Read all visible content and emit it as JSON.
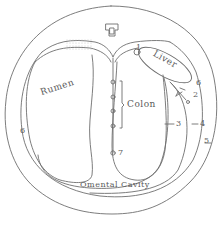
{
  "diagram": {
    "type": "anatomical cross-section",
    "colors": {
      "line": "#6e6e6e",
      "text": "#5a5a5a",
      "background": "#ffffff",
      "stipple": "#bdbdbd"
    },
    "organs": [
      {
        "id": "rumen",
        "label": "Rumen"
      },
      {
        "id": "liver",
        "label": "Liver"
      },
      {
        "id": "colon",
        "label": "Colon"
      },
      {
        "id": "omental-cavity",
        "label": "Omental Cavity"
      }
    ],
    "vertebra_icon": "vertebra-icon",
    "numbers": [
      {
        "id": "n1",
        "label": "1"
      },
      {
        "id": "n2",
        "label": "2"
      },
      {
        "id": "n3",
        "label": "3"
      },
      {
        "id": "n4",
        "label": "4"
      },
      {
        "id": "n5",
        "label": "5"
      },
      {
        "id": "n6-right",
        "label": "6"
      },
      {
        "id": "n6-left",
        "label": "6"
      },
      {
        "id": "n7",
        "label": "7"
      }
    ]
  }
}
